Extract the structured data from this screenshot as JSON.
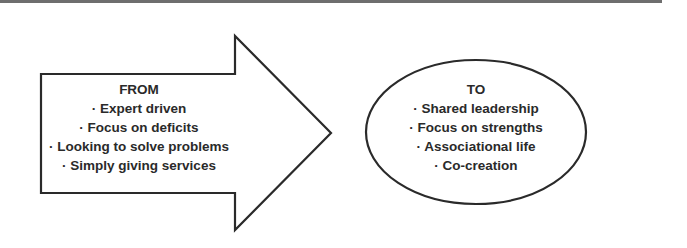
{
  "diagram": {
    "from": {
      "heading": "FROM",
      "items": [
        "· Expert driven",
        "· Focus on deficits",
        "· Looking to solve problems",
        "· Simply giving services"
      ]
    },
    "to": {
      "heading": "TO",
      "items": [
        "· Shared leadership",
        "· Focus on strengths",
        "· Associational life",
        "· Co-creation"
      ]
    },
    "colors": {
      "stroke": "#2a2a2a",
      "text": "#2a2a2a",
      "rule": "#6e6e6e",
      "background": "#ffffff"
    }
  }
}
